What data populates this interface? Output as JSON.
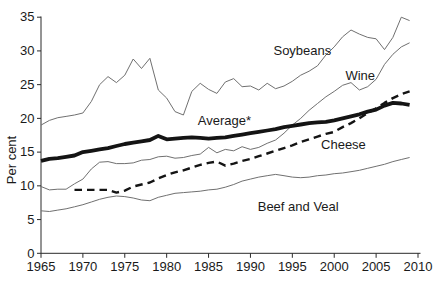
{
  "figure": {
    "background": "#ffffff",
    "axis_color": "#2a2a2a",
    "thin_line_color": "#707070",
    "thick_line_color": "#141414",
    "tick_font_px": 13,
    "label_font_px": 13
  },
  "chart_data": {
    "type": "line",
    "title": "",
    "xlabel": "",
    "ylabel": "Per cent",
    "xlim": [
      1965,
      2010
    ],
    "ylim": [
      0,
      35
    ],
    "xticks": [
      1965,
      1970,
      1975,
      1980,
      1985,
      1990,
      1995,
      2000,
      2005,
      2010
    ],
    "yticks": [
      0,
      5,
      10,
      15,
      20,
      25,
      30,
      35
    ],
    "grid": false,
    "legend_position": "inline-labels",
    "x": [
      1965,
      1966,
      1967,
      1968,
      1969,
      1970,
      1971,
      1972,
      1973,
      1974,
      1975,
      1976,
      1977,
      1978,
      1979,
      1980,
      1981,
      1982,
      1983,
      1984,
      1985,
      1986,
      1987,
      1988,
      1989,
      1990,
      1991,
      1992,
      1993,
      1994,
      1995,
      1996,
      1997,
      1998,
      1999,
      2000,
      2001,
      2002,
      2003,
      2004,
      2005,
      2006,
      2007,
      2008,
      2009
    ],
    "series": [
      {
        "name": "Soybeans",
        "style": "thin",
        "label_pos": {
          "x": 1996.2,
          "y": 30.0
        },
        "values": [
          19.0,
          19.7,
          20.1,
          20.3,
          20.5,
          20.8,
          22.5,
          25.0,
          26.2,
          25.3,
          26.4,
          28.8,
          27.4,
          28.9,
          24.2,
          23.0,
          21.0,
          20.5,
          24.0,
          25.2,
          24.3,
          23.7,
          25.4,
          25.9,
          24.7,
          24.8,
          24.2,
          25.2,
          24.4,
          24.8,
          25.5,
          26.4,
          27.0,
          27.8,
          29.4,
          30.6,
          32.1,
          33.1,
          32.5,
          32.0,
          31.8,
          30.2,
          32.0,
          35.0,
          34.5
        ]
      },
      {
        "name": "Wine",
        "style": "thin",
        "label_pos": {
          "x": 2003.1,
          "y": 26.4
        },
        "values": [
          9.9,
          9.4,
          9.5,
          9.5,
          10.3,
          11.0,
          12.5,
          13.5,
          13.6,
          13.3,
          13.3,
          13.4,
          13.8,
          13.9,
          14.3,
          14.4,
          14.1,
          14.2,
          14.5,
          14.7,
          15.7,
          14.9,
          15.4,
          15.2,
          15.8,
          15.4,
          15.7,
          16.3,
          16.8,
          17.8,
          19.0,
          20.0,
          21.2,
          22.2,
          23.2,
          24.0,
          24.9,
          25.3,
          24.2,
          24.7,
          25.8,
          28.0,
          29.5,
          30.6,
          31.2
        ]
      },
      {
        "name": "Average*",
        "style": "thick",
        "label_pos": {
          "x": 1986.9,
          "y": 19.7
        },
        "values": [
          13.7,
          14.0,
          14.1,
          14.3,
          14.5,
          15.0,
          15.2,
          15.4,
          15.6,
          15.9,
          16.2,
          16.4,
          16.6,
          16.8,
          17.4,
          16.9,
          17.0,
          17.1,
          17.2,
          17.1,
          17.0,
          17.1,
          17.2,
          17.4,
          17.6,
          17.8,
          18.0,
          18.2,
          18.4,
          18.7,
          18.9,
          19.1,
          19.3,
          19.4,
          19.5,
          19.7,
          20.0,
          20.3,
          20.6,
          21.0,
          21.3,
          21.9,
          22.3,
          22.2,
          22.0
        ]
      },
      {
        "name": "Cheese",
        "style": "dashed",
        "label_pos": {
          "x": 2001.1,
          "y": 16.1
        },
        "values": [
          null,
          null,
          null,
          null,
          9.4,
          9.4,
          9.4,
          9.4,
          9.4,
          9.0,
          9.3,
          9.9,
          10.2,
          10.5,
          11.1,
          11.6,
          12.0,
          12.3,
          12.7,
          13.1,
          13.4,
          13.6,
          13.0,
          13.3,
          13.7,
          14.0,
          14.4,
          14.8,
          15.2,
          15.6,
          16.0,
          16.5,
          16.9,
          17.3,
          17.7,
          18.0,
          18.7,
          19.3,
          20.0,
          20.8,
          21.5,
          22.3,
          23.0,
          23.6,
          24.0
        ]
      },
      {
        "name": "Beef and Veal",
        "style": "thin",
        "label_pos": {
          "x": 1995.7,
          "y": 7.0
        },
        "values": [
          6.3,
          6.2,
          6.4,
          6.6,
          6.9,
          7.2,
          7.6,
          8.0,
          8.3,
          8.5,
          8.4,
          8.2,
          7.9,
          7.8,
          8.3,
          8.6,
          8.9,
          9.0,
          9.1,
          9.2,
          9.4,
          9.5,
          9.8,
          10.2,
          10.7,
          11.0,
          11.3,
          11.5,
          11.7,
          11.5,
          11.3,
          11.2,
          11.3,
          11.5,
          11.6,
          11.8,
          11.9,
          12.1,
          12.3,
          12.6,
          12.9,
          13.2,
          13.6,
          13.9,
          14.2
        ]
      }
    ]
  }
}
